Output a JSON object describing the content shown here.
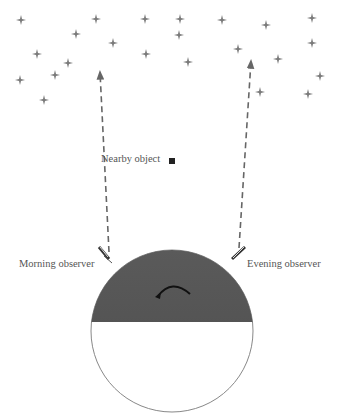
{
  "labels": {
    "nearby_object": "Nearby object",
    "morning_observer": "Morning observer",
    "evening_observer": "Evening observer"
  },
  "colors": {
    "star": "#7a7a7a",
    "line": "#666666",
    "earth_night": "#555555",
    "earth_outline": "#888888",
    "text": "#555555"
  },
  "stars": [
    [
      21,
      20
    ],
    [
      96,
      19
    ],
    [
      145,
      19
    ],
    [
      76,
      34
    ],
    [
      113,
      43
    ],
    [
      146,
      54
    ],
    [
      37,
      54
    ],
    [
      68,
      63
    ],
    [
      55,
      75
    ],
    [
      20,
      80
    ],
    [
      44,
      100
    ],
    [
      180,
      19
    ],
    [
      222,
      20
    ],
    [
      266,
      25
    ],
    [
      312,
      18
    ],
    [
      179,
      35
    ],
    [
      238,
      49
    ],
    [
      312,
      43
    ],
    [
      188,
      62
    ],
    [
      278,
      59
    ],
    [
      320,
      76
    ],
    [
      260,
      92
    ],
    [
      308,
      94
    ]
  ],
  "nearby_object": [
    172,
    161
  ],
  "earth": {
    "cx": 172,
    "cy": 331,
    "r": 81,
    "terminator_y": 322
  }
}
